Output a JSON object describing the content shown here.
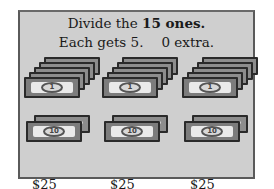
{
  "header": {
    "line1_prefix": "Divide the ",
    "line1_bold": "15 ones.",
    "line2_each": "Each gets 5.",
    "line2_extra": "0 extra."
  },
  "groups": [
    {
      "ones_count": 5,
      "ones_label": "1",
      "tens_count": 2,
      "tens_label": "10",
      "total": "$25"
    },
    {
      "ones_count": 5,
      "ones_label": "1",
      "tens_count": 2,
      "tens_label": "10",
      "total": "$25"
    },
    {
      "ones_count": 5,
      "ones_label": "1",
      "tens_count": 2,
      "tens_label": "10",
      "total": "$25"
    }
  ],
  "colors": {
    "panel_bg": "#cfcfcf",
    "border": "#5a5a5a",
    "text": "#1a1a1a"
  }
}
